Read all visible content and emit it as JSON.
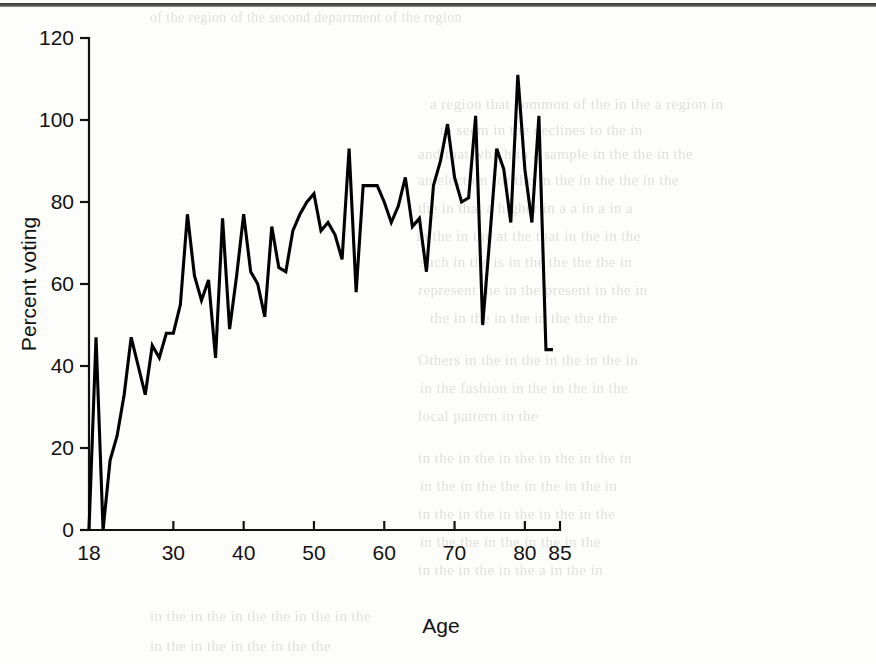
{
  "page": {
    "background_color": "#fdfdfc",
    "ink_color": "#000000",
    "bleed_through_lines": [
      {
        "text": "of the region of the second department of the region",
        "x": 150,
        "y": 10,
        "size": 14
      },
      {
        "text": "a region that common  of the in the  a region  in",
        "x": 430,
        "y": 96,
        "size": 15
      },
      {
        "text": "to  seem  in the  declines  to  the  in",
        "x": 440,
        "y": 122,
        "size": 15
      },
      {
        "text": "and that which in  a sample in the  the  in the",
        "x": 418,
        "y": 146,
        "size": 15
      },
      {
        "text": "an election for the  in the  in the  the  in the",
        "x": 418,
        "y": 172,
        "size": 15
      },
      {
        "text": "the  in that  a  higher  in  a  a  in  a  in  a",
        "x": 418,
        "y": 200,
        "size": 15
      },
      {
        "text": "in the  in  the  at  the  that  in  the  in  the",
        "x": 416,
        "y": 228,
        "size": 15
      },
      {
        "text": "such  in the  is  in  the  the  the  the  in",
        "x": 420,
        "y": 254,
        "size": 15
      },
      {
        "text": "represent the  in  the  present  in  the  in",
        "x": 418,
        "y": 282,
        "size": 15
      },
      {
        "text": "the  in  the  in  the  in  the  the  the",
        "x": 430,
        "y": 310,
        "size": 15
      },
      {
        "text": "Others  in  the  in  the  in  the  in  the  in",
        "x": 418,
        "y": 352,
        "size": 15
      },
      {
        "text": "in  the  fashion  in  the  in  the  in  the",
        "x": 420,
        "y": 380,
        "size": 15
      },
      {
        "text": "local  pattern  in  the",
        "x": 418,
        "y": 408,
        "size": 15
      },
      {
        "text": "in  the  in  the  in  the  in  the  in  the  in",
        "x": 418,
        "y": 450,
        "size": 15
      },
      {
        "text": "in  the  in  the  the  in  the  in  the  in",
        "x": 420,
        "y": 478,
        "size": 15
      },
      {
        "text": "in  the  in  the  in  the  in  the  in  the",
        "x": 418,
        "y": 506,
        "size": 15
      },
      {
        "text": "in  the  the  in  the  in  the  in  the",
        "x": 420,
        "y": 534,
        "size": 15
      },
      {
        "text": "in  the  in  the  in  the  a  in  the  in",
        "x": 418,
        "y": 562,
        "size": 15
      },
      {
        "text": "in  the  in  the  in  the  the  in  the  in  the",
        "x": 150,
        "y": 608,
        "size": 15
      },
      {
        "text": "in  the  in  the  in  the  in  the  the",
        "x": 150,
        "y": 638,
        "size": 15
      }
    ]
  },
  "chart_data": {
    "type": "line",
    "title": "",
    "xlabel": "Age",
    "ylabel": "Percent voting",
    "xlim": [
      18,
      85
    ],
    "ylim": [
      0,
      120
    ],
    "grid": false,
    "legend": null,
    "xticks": [
      18,
      30,
      40,
      50,
      60,
      70,
      80,
      85
    ],
    "xtick_labels": [
      "18",
      "30",
      "40",
      "50",
      "60",
      "70",
      "80",
      "85"
    ],
    "yticks": [
      0,
      20,
      40,
      60,
      80,
      100,
      120
    ],
    "ytick_labels": [
      "0",
      "20",
      "40",
      "60",
      "80",
      "100",
      "120"
    ],
    "series": [
      {
        "name": "Percent voting",
        "color": "#000000",
        "x": [
          18,
          19,
          20,
          21,
          22,
          23,
          24,
          25,
          26,
          27,
          28,
          29,
          30,
          31,
          32,
          33,
          34,
          35,
          36,
          37,
          38,
          39,
          40,
          41,
          42,
          43,
          44,
          45,
          46,
          47,
          48,
          49,
          50,
          51,
          52,
          53,
          54,
          55,
          56,
          57,
          58,
          59,
          60,
          61,
          62,
          63,
          64,
          65,
          66,
          67,
          68,
          69,
          70,
          71,
          72,
          73,
          74,
          75,
          76,
          77,
          78,
          79,
          80,
          81,
          82,
          83,
          84
        ],
        "values": [
          0,
          47,
          0,
          17,
          23,
          33,
          47,
          40,
          33,
          45,
          42,
          48,
          48,
          55,
          77,
          62,
          56,
          61,
          42,
          76,
          49,
          62,
          77,
          63,
          60,
          52,
          74,
          64,
          63,
          73,
          77,
          80,
          82,
          73,
          75,
          72,
          66,
          93,
          58,
          84,
          84,
          84,
          80,
          75,
          79,
          86,
          74,
          76,
          63,
          84,
          90,
          99,
          86,
          80,
          81,
          101,
          50,
          71,
          93,
          88,
          75,
          111,
          88,
          75,
          101,
          44,
          44
        ]
      }
    ]
  },
  "axes": {
    "y_axis_label": "Percent voting",
    "x_axis_label": "Age"
  }
}
